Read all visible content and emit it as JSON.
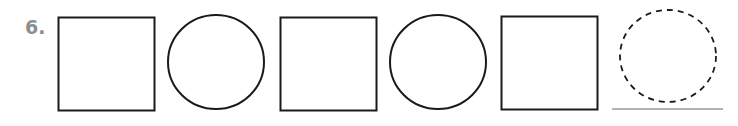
{
  "problem": {
    "number_label": "6.",
    "pattern": [
      "square",
      "circle",
      "square",
      "circle",
      "square",
      "blank-dashed-circle"
    ],
    "answer_blank": "dashed circle with answer line"
  },
  "colors": {
    "label": "#8e8e8e",
    "stroke": "#1a1a1a",
    "answer_line": "#9a9a9a"
  }
}
